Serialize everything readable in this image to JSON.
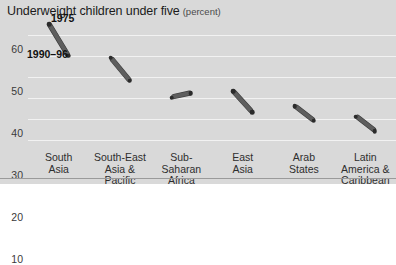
{
  "chart_data": {
    "type": "line",
    "title": "Underweight children under five",
    "subtitle": "(percent)",
    "xlabel": "",
    "ylabel": "",
    "ylim": [
      5,
      67
    ],
    "yticks": [
      60,
      50,
      40,
      30,
      20,
      10
    ],
    "grid": true,
    "legend_position": "inside-upper-left",
    "legend": [
      {
        "label": "1975"
      },
      {
        "label": "1990–96"
      }
    ],
    "categories": [
      "South Asia",
      "South-East Asia & Pacific",
      "Sub-Saharan Africa",
      "East Asia",
      "Arab States",
      "Latin America & Caribbean"
    ],
    "category_lines": [
      [
        "South",
        "Asia"
      ],
      [
        "South-East",
        "Asia & Pacific"
      ],
      [
        "Sub-",
        "Saharan",
        "Africa"
      ],
      [
        "East",
        "Asia"
      ],
      [
        "Arab",
        "States"
      ],
      [
        "Latin",
        "America &",
        "Caribbean"
      ]
    ],
    "series": [
      {
        "name": "1975",
        "values": [
          65,
          49,
          30,
          33,
          26,
          21
        ]
      },
      {
        "name": "1990–96",
        "values": [
          50,
          38,
          32,
          23,
          19,
          14
        ]
      }
    ]
  },
  "colors": {
    "background": "#d9d9d9",
    "gridline": "#f2f2f2",
    "segment": "#5e5e5e",
    "endpoint": "#2b2b2b",
    "title_text": "#1b1b1b",
    "axis_text": "#3a3a3a",
    "rule": "#9a9a9a"
  }
}
